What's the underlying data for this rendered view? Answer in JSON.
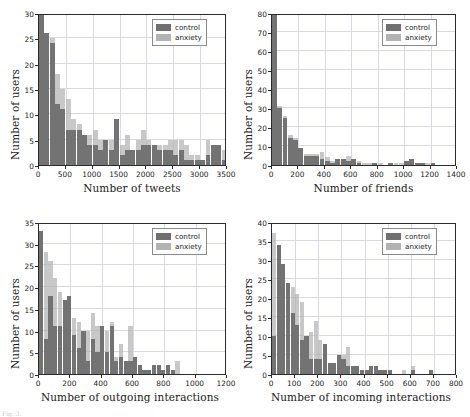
{
  "figure": {
    "caption": "Fig. 3.",
    "legend_labels": [
      "control",
      "anxiety"
    ],
    "colors": {
      "control": "#6f6f6f",
      "anxiety": "#b3b3b3",
      "grid": "#d9d9e3",
      "axis": "#2b2b2b"
    }
  },
  "chart_data": [
    {
      "type": "bar",
      "panel": "top-left",
      "title": "",
      "xlabel": "Number of tweets",
      "ylabel": "Number of users",
      "xlim": [
        0,
        3500
      ],
      "ylim": [
        0,
        30
      ],
      "xticks": [
        0,
        500,
        1000,
        1500,
        2000,
        2500,
        3000,
        3500
      ],
      "yticks": [
        0,
        5,
        10,
        15,
        20,
        25,
        30
      ],
      "grid": true,
      "legend_position": "upper right",
      "bin_width": 100,
      "x": [
        50,
        150,
        250,
        350,
        450,
        550,
        650,
        750,
        850,
        950,
        1050,
        1150,
        1250,
        1350,
        1450,
        1550,
        1650,
        1750,
        1850,
        1950,
        2050,
        2150,
        2250,
        2350,
        2450,
        2550,
        2650,
        2750,
        2850,
        2950,
        3050,
        3150,
        3250,
        3350,
        3450
      ],
      "series": [
        {
          "name": "control",
          "values": [
            30,
            26,
            24,
            12,
            11,
            7,
            7,
            7,
            6,
            4,
            4,
            3,
            5,
            3,
            9,
            2,
            3,
            3,
            3,
            4,
            4,
            4,
            3,
            3,
            3,
            2,
            3,
            1,
            1,
            1,
            1,
            2,
            4,
            4,
            1
          ]
        },
        {
          "name": "anxiety",
          "values": [
            30,
            26,
            25,
            18,
            15,
            13,
            9,
            8,
            6,
            6,
            7,
            5,
            5,
            5,
            9,
            4,
            6,
            3,
            5,
            7,
            5,
            4,
            4,
            4,
            5,
            5,
            5,
            4,
            2,
            2,
            1,
            5,
            4,
            4,
            3
          ]
        }
      ]
    },
    {
      "type": "bar",
      "panel": "top-right",
      "title": "",
      "xlabel": "Number of friends",
      "ylabel": "Number of users",
      "xlim": [
        0,
        1400
      ],
      "ylim": [
        0,
        80
      ],
      "xticks": [
        0,
        200,
        400,
        600,
        800,
        1000,
        1200,
        1400
      ],
      "yticks": [
        0,
        10,
        20,
        30,
        40,
        50,
        60,
        70,
        80
      ],
      "grid": true,
      "legend_position": "upper right",
      "bin_width": 40,
      "x": [
        20,
        60,
        100,
        140,
        180,
        220,
        260,
        300,
        340,
        380,
        420,
        460,
        500,
        540,
        580,
        620,
        660,
        700,
        740,
        780,
        820,
        860,
        900,
        940,
        980,
        1020,
        1060,
        1100,
        1140,
        1180,
        1220,
        1260,
        1300,
        1340,
        1380
      ],
      "series": [
        {
          "name": "control",
          "values": [
            79,
            30,
            25,
            14,
            13,
            9,
            5,
            5,
            5,
            3,
            2,
            1,
            3,
            3,
            2,
            3,
            1,
            0,
            0,
            1,
            0,
            0,
            1,
            0,
            0,
            2,
            3,
            1,
            1,
            0,
            1,
            0,
            0,
            0,
            0
          ]
        },
        {
          "name": "anxiety",
          "values": [
            79,
            31,
            26,
            16,
            14,
            9,
            6,
            6,
            6,
            7,
            4,
            2,
            3,
            3,
            5,
            3,
            2,
            1,
            1,
            1,
            1,
            0,
            1,
            1,
            1,
            2,
            3,
            1,
            1,
            1,
            1,
            0,
            0,
            0,
            0
          ]
        }
      ]
    },
    {
      "type": "bar",
      "panel": "bottom-left",
      "title": "",
      "xlabel": "Number of outgoing interactions",
      "ylabel": "Number of users",
      "xlim": [
        0,
        1200
      ],
      "ylim": [
        0,
        35
      ],
      "xticks": [
        0,
        200,
        400,
        600,
        800,
        1000,
        1200
      ],
      "yticks": [
        0,
        5,
        10,
        15,
        20,
        25,
        30,
        35
      ],
      "grid": true,
      "legend_position": "upper right",
      "bin_width": 30,
      "x": [
        15,
        45,
        75,
        105,
        135,
        165,
        195,
        225,
        255,
        285,
        315,
        345,
        375,
        405,
        435,
        465,
        495,
        525,
        555,
        585,
        615,
        645,
        675,
        705,
        735,
        765,
        795,
        825,
        855,
        885,
        915,
        945,
        975,
        1005,
        1035,
        1065,
        1095,
        1125,
        1155,
        1185
      ],
      "series": [
        {
          "name": "control",
          "values": [
            33,
            8,
            18,
            11,
            11,
            17,
            18,
            9,
            6,
            10,
            3,
            8,
            5,
            11,
            5,
            11,
            3,
            4,
            3,
            3,
            4,
            2,
            1,
            1,
            2,
            2,
            1,
            2,
            1,
            0,
            0,
            0,
            0,
            0,
            0,
            0,
            0,
            0,
            0,
            0
          ]
        },
        {
          "name": "anxiety",
          "values": [
            33,
            28,
            26,
            22,
            19,
            17,
            18,
            13,
            12,
            10,
            10,
            14,
            11,
            11,
            10,
            12,
            4,
            7,
            3,
            11,
            4,
            2,
            1,
            1,
            2,
            2,
            1,
            2,
            1,
            3,
            0,
            0,
            0,
            0,
            0,
            0,
            0,
            0,
            0,
            0
          ]
        }
      ]
    },
    {
      "type": "bar",
      "panel": "bottom-right",
      "title": "",
      "xlabel": "Number of incoming interactions",
      "ylabel": "Number of users",
      "xlim": [
        0,
        800
      ],
      "ylim": [
        0,
        40
      ],
      "xticks": [
        0,
        100,
        200,
        300,
        400,
        500,
        600,
        700,
        800
      ],
      "yticks": [
        0,
        5,
        10,
        15,
        20,
        25,
        30,
        35,
        40
      ],
      "grid": true,
      "legend_position": "upper right",
      "bin_width": 20,
      "x": [
        10,
        30,
        50,
        70,
        90,
        110,
        130,
        150,
        170,
        190,
        210,
        230,
        250,
        270,
        290,
        310,
        330,
        350,
        370,
        390,
        410,
        430,
        450,
        470,
        490,
        510,
        530,
        550,
        570,
        590,
        610,
        630,
        650,
        670,
        690,
        710,
        730,
        750,
        770,
        790
      ],
      "series": [
        {
          "name": "control",
          "values": [
            10,
            34,
            29,
            24,
            16,
            13,
            9,
            10,
            4,
            4,
            4,
            8,
            3,
            3,
            5,
            4,
            2,
            2,
            2,
            1,
            1,
            2,
            2,
            1,
            1,
            1,
            0,
            0,
            0,
            0,
            1,
            0,
            0,
            0,
            1,
            0,
            0,
            0,
            0,
            0
          ]
        },
        {
          "name": "anxiety",
          "values": [
            37,
            34,
            29,
            24,
            23,
            21,
            19,
            10,
            11,
            14,
            9,
            8,
            3,
            3,
            5,
            5,
            7,
            2,
            2,
            1,
            1,
            2,
            2,
            1,
            1,
            1,
            0,
            0,
            1,
            0,
            2,
            0,
            0,
            0,
            1,
            0,
            0,
            0,
            0,
            0
          ]
        }
      ]
    }
  ]
}
